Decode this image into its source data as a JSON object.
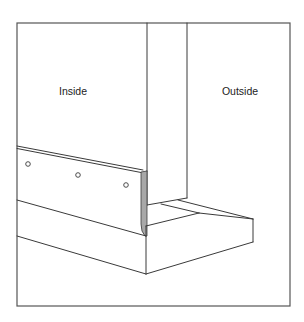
{
  "diagram": {
    "type": "technical-illustration",
    "labels": {
      "inside": "Inside",
      "outside": "Outside"
    },
    "colors": {
      "line": "#3a3a3a",
      "frame": "#555555",
      "flashing_edge": "#a8a8a8",
      "background": "#ffffff"
    },
    "fastener_holes_count": 3
  }
}
